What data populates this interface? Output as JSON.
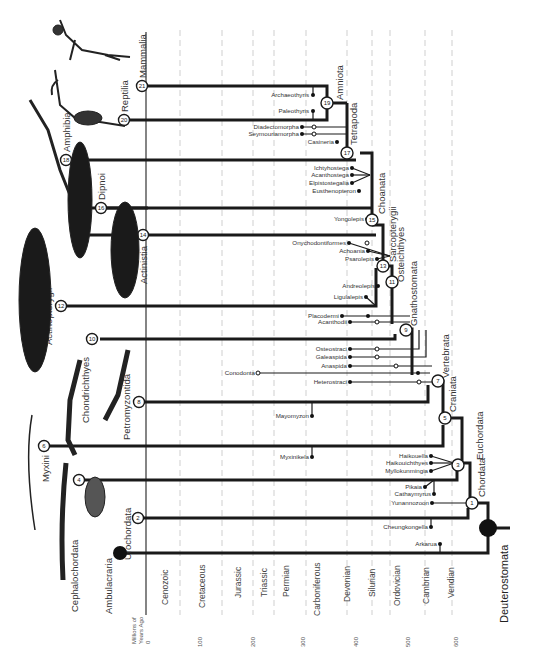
{
  "axis": {
    "label_line1": "Millions of",
    "label_line2": "Years Ago",
    "ticks": [
      "0",
      "100",
      "200",
      "300",
      "400",
      "500",
      "600"
    ]
  },
  "periods": [
    "Cenozoic",
    "Cretaceous",
    "Jurassic",
    "Triassic",
    "Permian",
    "Carboniferous",
    "Devonian",
    "Silurian",
    "Ordovician",
    "Cambrian",
    "Vendian"
  ],
  "root": {
    "label": "Deuterostomata"
  },
  "terminal_groups": [
    {
      "node": "21",
      "label": "Mammalia"
    },
    {
      "node": "20",
      "label": "Reptilia"
    },
    {
      "node": "18",
      "label": "Amphibia"
    },
    {
      "node": "16",
      "label": "Dipnoi"
    },
    {
      "node": "14",
      "label": "Actinistia"
    },
    {
      "node": "12",
      "label": "Actinopterygii"
    },
    {
      "node": "10",
      "label": "Chondrichthyes"
    },
    {
      "node": "8",
      "label": "Petromyzontida"
    },
    {
      "node": "6",
      "label": "Myxini"
    },
    {
      "node": "4",
      "label": "Cephalochordata"
    },
    {
      "node": "2",
      "label": "Urochordata"
    },
    {
      "node": "",
      "label": "Ambulacraria"
    }
  ],
  "clades": [
    {
      "node": "19",
      "label": "Amniota"
    },
    {
      "node": "17",
      "label": "Tetrapoda"
    },
    {
      "node": "15",
      "label": "Choanata"
    },
    {
      "node": "13",
      "label": "Sarcopterygii"
    },
    {
      "node": "11",
      "label": "Osteichthyes"
    },
    {
      "node": "9",
      "label": "Gnathostomata"
    },
    {
      "node": "7",
      "label": "Vertebrata"
    },
    {
      "node": "5",
      "label": "Craniata"
    },
    {
      "node": "3",
      "label": "Euchordata"
    },
    {
      "node": "1",
      "label": "Chordata"
    }
  ],
  "fossils": [
    "Archaeothyris",
    "Paleothyris",
    "Diadectomorpha",
    "Seymouriamorpha",
    "Casineria",
    "Ichtyhostega",
    "Acanthostega",
    "Elpistostegalia",
    "Eusthenopteron",
    "Yongolepis",
    "Onychodontiformes",
    "Achoania",
    "Psarolepis",
    "Andreolepis",
    "Ligulalepis",
    "Placodermi",
    "Acanthodii",
    "Osteostraci",
    "Galeaspida",
    "Anaspida",
    "Conodonta",
    "Heterostraci",
    "Mayomyzon",
    "Myxinikela",
    "Haikouella",
    "Haikouichthyes",
    "Myllokunmingia",
    "Pikaia",
    "Cathaymyrus",
    "Yunannozoon",
    "Cheungkongella",
    "Arkarua"
  ]
}
